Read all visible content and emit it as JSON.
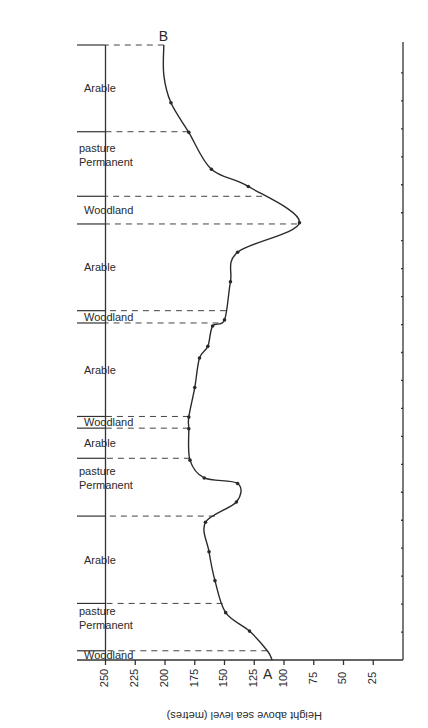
{
  "chart_data": {
    "type": "line",
    "title": "",
    "orientation_note": "figure printed rotated 180 degrees",
    "xlabel": "Distance along transect (A to B)",
    "ylabel": "Height above sea level (metres)",
    "ylim": [
      0,
      250
    ],
    "yticks": [
      250,
      225,
      200,
      175,
      150,
      125,
      100,
      75,
      50,
      25
    ],
    "grid": false,
    "endpoints": {
      "start": "A",
      "end": "B"
    },
    "profile": {
      "description": "Height (m) at positions along transect, 0 = A, 1 = B",
      "x": [
        0.0,
        0.015,
        0.047,
        0.077,
        0.129,
        0.176,
        0.224,
        0.257,
        0.287,
        0.296,
        0.325,
        0.376,
        0.395,
        0.443,
        0.491,
        0.51,
        0.543,
        0.553,
        0.615,
        0.663,
        0.711,
        0.77,
        0.798,
        0.858,
        0.906,
        0.951,
        1.0
      ],
      "height": [
        110,
        114,
        129,
        149,
        158,
        163,
        166,
        140,
        139,
        167,
        179,
        180,
        180,
        175,
        171,
        164,
        160,
        150,
        145,
        139,
        87,
        130,
        161,
        180,
        195,
        201,
        201
      ]
    },
    "land_use_segments": [
      {
        "label": "Woodland",
        "from": 0.0,
        "to": 0.015
      },
      {
        "label": "Permanent pasture",
        "from": 0.015,
        "to": 0.092
      },
      {
        "label": "Arable",
        "from": 0.092,
        "to": 0.234
      },
      {
        "label": "Permanent pasture",
        "from": 0.234,
        "to": 0.328
      },
      {
        "label": "Arable",
        "from": 0.328,
        "to": 0.377
      },
      {
        "label": "Woodland",
        "from": 0.377,
        "to": 0.396
      },
      {
        "label": "Arable",
        "from": 0.396,
        "to": 0.548
      },
      {
        "label": "Woodland",
        "from": 0.548,
        "to": 0.568
      },
      {
        "label": "Arable",
        "from": 0.568,
        "to": 0.709
      },
      {
        "label": "Woodland",
        "from": 0.709,
        "to": 0.754
      },
      {
        "label": "Permanent pasture",
        "from": 0.754,
        "to": 0.859
      },
      {
        "label": "Arable",
        "from": 0.859,
        "to": 1.0
      }
    ],
    "marked_points_height": [
      129,
      158,
      163,
      139,
      171,
      175,
      150,
      145,
      130,
      161,
      180,
      195
    ]
  },
  "labels": {
    "point_a": "A",
    "point_b": "B",
    "axis_title": "Height above sea level (metres)"
  }
}
